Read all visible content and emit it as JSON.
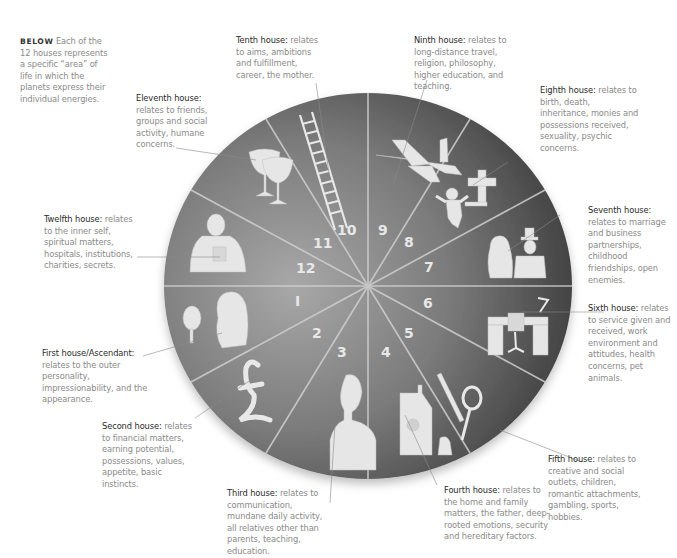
{
  "intro": {
    "keyword": "BELOW",
    "text": "Each of the 12 houses represents a specific “area” of life in which the planets express their individual energies."
  },
  "houses": [
    {
      "number": "1",
      "title": "First house/Ascendant:",
      "description": "relates to the outer personality, impressionability, and the appearance.",
      "icon": "woman-with-mirror-icon"
    },
    {
      "number": "2",
      "title": "Second house:",
      "description": "relates to financial matters, earning potential, possessions, values, appetite, basic instincts.",
      "icon": "pound-sign-icon"
    },
    {
      "number": "3",
      "title": "Third house:",
      "description": "relates to communication, mundane daily activity, all relatives other than parents, teaching, education.",
      "icon": "man-on-phone-icon"
    },
    {
      "number": "4",
      "title": "Fourth house:",
      "description": "relates to the home and family matters, the father, deep-rooted emotions, security and hereditary factors.",
      "icon": "house-family-icon"
    },
    {
      "number": "5",
      "title": "Fifth house:",
      "description": "relates to creative and social outlets, children, romantic attachments, gambling, sports, hobbies.",
      "icon": "paintbrush-racket-icon"
    },
    {
      "number": "6",
      "title": "Sixth house:",
      "description": "relates to service given and received, work environment and attitudes, health concerns, pet animals.",
      "icon": "desk-lamp-icon"
    },
    {
      "number": "7",
      "title": "Seventh house:",
      "description": "relates to marriage and business partnerships, childhood friendships, open enemies.",
      "icon": "couple-icon"
    },
    {
      "number": "8",
      "title": "Eighth house:",
      "description": "relates to birth, death, inheritance, monies and possessions received, sexuality, psychic concerns.",
      "icon": "baby-and-cross-icon"
    },
    {
      "number": "9",
      "title": "Ninth house:",
      "description": "relates to long-distance travel, religion, philosophy, higher education, and teaching.",
      "icon": "airplane-icon"
    },
    {
      "number": "10",
      "title": "Tenth house:",
      "description": "relates to aims, ambitions and fulfillment, career, the mother.",
      "icon": "ladder-icon"
    },
    {
      "number": "11",
      "title": "Eleventh house:",
      "description": "relates to friends, groups and social activity, humane concerns.",
      "icon": "wine-glasses-icon"
    },
    {
      "number": "12",
      "title": "Twelfth house:",
      "description": "relates to the inner self, spiritual matters, hospitals, institutions, charities, secrets.",
      "icon": "person-silhouette-icon"
    }
  ],
  "colors": {
    "wheel_light": "#a4a4a4",
    "wheel_dark": "#3c3c3c",
    "divider": "#d6d6d6",
    "icon_fill": "#e6e6e6",
    "heading_text": "#2a2a2a",
    "body_text": "#8a8a8a",
    "leader_line": "#8a8a8a"
  }
}
